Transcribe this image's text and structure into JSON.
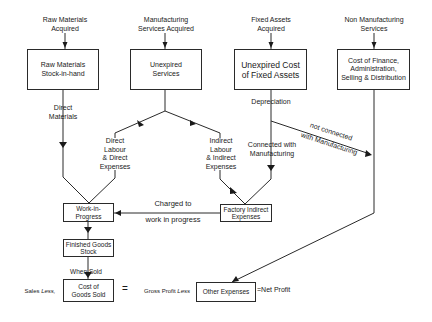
{
  "sources": {
    "raw_materials": "Raw Materials\nAcquired",
    "manufacturing_services": "Manufacturing\nServices Acquired",
    "fixed_assets": "Fixed Assets\nAcquired",
    "non_manufacturing": "Non Manufacturing\nServices"
  },
  "boxes": {
    "raw_stock": "Raw Materials\nStock-in-hand",
    "unexpired_services": "Unexpired\nServices",
    "unexpired_fixed": "Unexpired Cost\nof Fixed Assets",
    "finance_cost": "Cost of Finance,\nAdministration,\nSelling & Distribution",
    "wip": "Work-in-\nProgress",
    "finished_goods": "Finished Goods\nStock",
    "cogs": "Cost of\nGoods Sold",
    "factory_indirect": "Factory Indirect\nExpenses",
    "other_expenses": "Other Expenses"
  },
  "labels": {
    "direct_materials": "Direct\nMaterials",
    "direct_labour": "Direct\nLabour\n& Direct\nExpenses",
    "indirect_labour": "Indirect\nLabour\n& Indirect\nExpenses",
    "depreciation": "Depreciation",
    "connected": "Connected with\nManufacturing",
    "not_connected_1": "not connected",
    "not_connected_2": "with Manufacturing",
    "charged_1": "Charged to",
    "charged_2": "work in progress",
    "when_sold": "When Sold"
  },
  "equation": {
    "sales_less": "Sales",
    "sales_less_italic": "Less,",
    "equals": "=",
    "gross_profit": "Gross Profit",
    "gross_profit_less": "Less",
    "net_profit": "=Net Profit"
  }
}
